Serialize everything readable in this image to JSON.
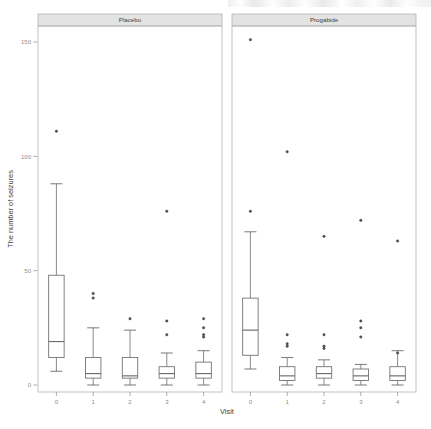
{
  "figure": {
    "background_color": "#ffffff",
    "line_color": "#6b6b6b",
    "strip_fill": "#e3e3e3",
    "strip_border": "#b4b4b4",
    "panel_border": "#b4b4b4",
    "text_color": "#4a4a4a",
    "tick_color": "#8c8c8c",
    "outlier_color": "#4d4d4d"
  },
  "chart_data": {
    "type": "box",
    "title": "",
    "subtitle": "",
    "xlabel": "Visit",
    "ylabel": "The number of seizures",
    "x_categories": [
      "0",
      "1",
      "2",
      "3",
      "4"
    ],
    "x_tick_labels": [
      "0",
      "1",
      "2",
      "3",
      "4"
    ],
    "y_tick_labels": [
      "0",
      "50",
      "100",
      "150"
    ],
    "y_tick_values": [
      0,
      50,
      100,
      150
    ],
    "ylim": [
      -6,
      160
    ],
    "grid": false,
    "legend": "none",
    "facet_variable": "Treatment",
    "facets": [
      {
        "label": "Placebo",
        "boxes": [
          {
            "category": "0",
            "whisker_low": 6,
            "q1": 12,
            "median": 19,
            "q3": 48,
            "whisker_high": 88,
            "outliers": [
              111
            ]
          },
          {
            "category": "1",
            "whisker_low": 0,
            "q1": 3,
            "median": 5,
            "q3": 12,
            "whisker_high": 25,
            "outliers": [
              40,
              38
            ]
          },
          {
            "category": "2",
            "whisker_low": 0,
            "q1": 3,
            "median": 4,
            "q3": 12,
            "whisker_high": 24,
            "outliers": [
              29
            ]
          },
          {
            "category": "3",
            "whisker_low": 0,
            "q1": 3,
            "median": 5,
            "q3": 8,
            "whisker_high": 14,
            "outliers": [
              76,
              28,
              22
            ]
          },
          {
            "category": "4",
            "whisker_low": 0,
            "q1": 3,
            "median": 5,
            "q3": 10,
            "whisker_high": 15,
            "outliers": [
              29,
              25,
              22,
              21
            ]
          }
        ]
      },
      {
        "label": "Progabide",
        "boxes": [
          {
            "category": "0",
            "whisker_low": 7,
            "q1": 13,
            "median": 24,
            "q3": 38,
            "whisker_high": 67,
            "outliers": [
              151,
              76
            ]
          },
          {
            "category": "1",
            "whisker_low": 0,
            "q1": 2,
            "median": 4,
            "q3": 8,
            "whisker_high": 12,
            "outliers": [
              102,
              22,
              18,
              17
            ]
          },
          {
            "category": "2",
            "whisker_low": 0,
            "q1": 3,
            "median": 5,
            "q3": 8,
            "whisker_high": 11,
            "outliers": [
              65,
              22,
              17,
              16
            ]
          },
          {
            "category": "3",
            "whisker_low": 0,
            "q1": 2,
            "median": 4,
            "q3": 7,
            "whisker_high": 9,
            "outliers": [
              72,
              28,
              25,
              21
            ]
          },
          {
            "category": "4",
            "whisker_low": 0,
            "q1": 2,
            "median": 4,
            "q3": 8,
            "whisker_high": 15,
            "outliers": [
              63,
              14
            ]
          }
        ]
      }
    ]
  }
}
